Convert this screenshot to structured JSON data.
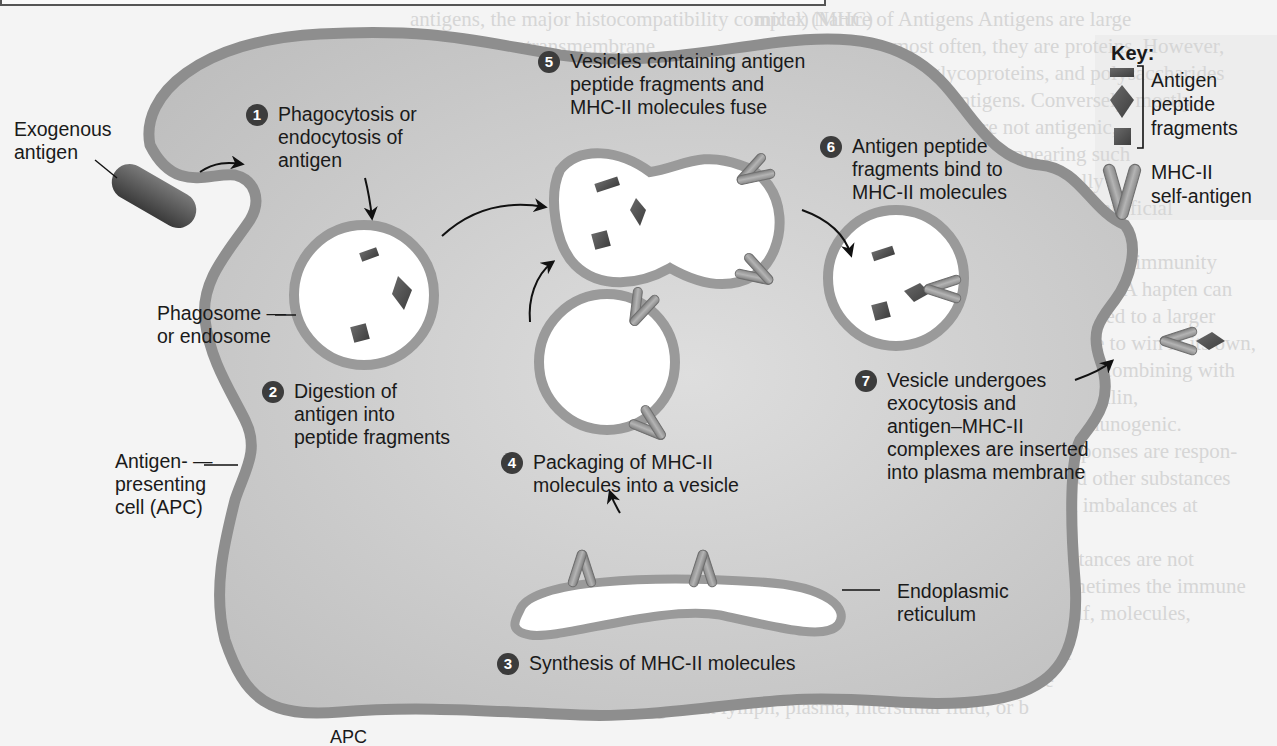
{
  "background_text": {
    "heading": "Pathways of Antigen Processing",
    "lines_right": [
      "mical) Nature of Antigens  Antigens are large",
      "plex molecules; most often, they are proteins. However,",
      "e, and nucleic acids, glycoproteins, and polysaccharides",
      "ucleic acids also act as antigens. Conversely, mostly",
      "lly, these large molecules are not antigenic,",
      "large molecules are not often appearing such",
      "les, simple molecules that are structurally",
      "nic. This is why plastic materials used in artificial",
      "t valves, work.",
      "smaller substance that is ready will but lacks immunity",
      "single, called a hapten (hap-ten = to grasp). A hapten can",
      "ulate antibody response only if it is attached to a larger",
      "er molecule. So a hapten, which is unable to win in its own,",
      "which triggers an immune response after combining with",
      "dy proteins. Other haptens, such as penicillin,",
      "bine with a carrier and then become immunogenic.",
      "es, such hapten-stimulated immune responses are respon-",
      "for some allergic reactions to drugs and other substances",
      "e environment that are associated with imbalances at",
      "end of the scale.",
      "As a rule, our body's own foreign substances are not",
      "lly part of body's organs; however, sometimes the immune",
      "em fails to distinguish self from nonself, molecules,"
    ],
    "lines_middle": [
      "antigens, the major histocompatibility complex (MHC)",
      "tigens. These transmembrane",
      "glycoproteins are also called human leukocyte antigens",
      "because they were first identified on white blood cells",
      "have an identical set of MHC molecules",
      "unless we develop (identical twins), MHC molecules m",
      "the surface of each of our body cells except red blood c",
      "Although MHC proteins are the reason that tissues may b",
      "rejected when they are transplanted from one person to anot",
      "their normal function is to help T cells recognize that an ant",
      "is foreign, not self. Such recognition is an important first st",
      "any adaptive immune responses.",
      "The two types of major histocompatibility complex",
      "proteins are class I and class II. Class I MHC molecules",
      "are built into the plasma membranes of all body cells except",
      "blood cells. Class II MHC (MHC-II) molecules appear on the",
      "surface of antigen-presenting cells (described in the next sect"
    ],
    "lines_bottom": [
      "For an immune response to occur, B cells and T cells must re",
      "nize that a foreign antigen is present. B cells can recognize",
      "bind to antigens in lymph, plasma, interstitial fluid, or b"
    ],
    "bottom_fragment": "APC"
  },
  "labels": {
    "exogenous_antigen": [
      "Exogenous",
      "antigen"
    ],
    "phagosome": [
      "Phagosome —",
      "or endosome"
    ],
    "apc": [
      "Antigen-  —",
      "presenting",
      "cell (APC)"
    ],
    "endoplasmic_reticulum": [
      "Endoplasmic",
      "reticulum"
    ]
  },
  "steps": [
    {
      "num": "1",
      "lines": [
        "Phagocytosis or",
        "endocytosis of",
        "antigen"
      ]
    },
    {
      "num": "2",
      "lines": [
        "Digestion of",
        "antigen into",
        "peptide fragments"
      ]
    },
    {
      "num": "3",
      "lines": [
        "Synthesis of MHC-II molecules"
      ]
    },
    {
      "num": "4",
      "lines": [
        "Packaging of MHC-II",
        "molecules into a vesicle"
      ]
    },
    {
      "num": "5",
      "lines": [
        "Vesicles containing antigen",
        "peptide fragments and",
        "MHC-II molecules fuse"
      ]
    },
    {
      "num": "6",
      "lines": [
        "Antigen peptide",
        "fragments bind to",
        "MHC-II molecules"
      ]
    },
    {
      "num": "7",
      "lines": [
        "Vesicle undergoes",
        "exocytosis and",
        "antigen–MHC-II",
        "complexes are inserted",
        "into plasma membrane"
      ]
    }
  ],
  "key": {
    "title": "Key:",
    "fragments_label": [
      "Antigen",
      "peptide",
      "fragments"
    ],
    "mhc_label": [
      "MHC-II",
      "self-antigen"
    ],
    "fragment_icons": [
      "rectangle-fragment-icon",
      "diamond-fragment-icon",
      "square-fragment-icon"
    ],
    "mhc_icon": "mhc-ii-molecule-icon"
  },
  "colors": {
    "cell_fill": "#c9c9c9",
    "membrane": "#8e8e8e",
    "vesicle_fill": "#ffffff",
    "fragment": "#555555",
    "mhc": "#9a9a9a",
    "step_badge": "#3c3c3c",
    "text": "#1a1a1a"
  }
}
